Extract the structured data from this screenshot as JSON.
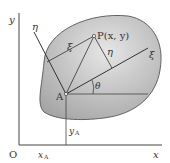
{
  "diagram": {
    "axes": {
      "x_label": "x",
      "y_label": "y",
      "origin_label": "O",
      "xA_label": "x",
      "xA_sub": "A",
      "yA_label": "y",
      "yA_sub": "A"
    },
    "rotated_axes": {
      "xi_label": "ξ",
      "eta_label": "η",
      "angle_label": "θ"
    },
    "points": {
      "A_label": "A",
      "P_label": "P(x, y)"
    },
    "segments": {
      "xi_label": "ξ",
      "eta_label": "η"
    },
    "colors": {
      "region_fill": "#b8b8b8",
      "region_edge": "#555555",
      "line": "#444444"
    }
  }
}
